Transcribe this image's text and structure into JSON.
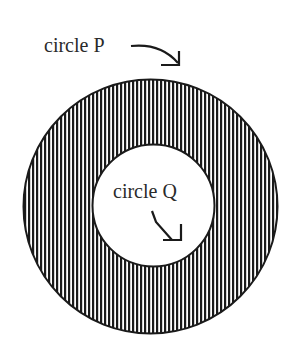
{
  "diagram": {
    "type": "concentric-circles",
    "outer_circle": {
      "label": "circle P",
      "cx": 150.5,
      "cy": 206.5,
      "r": 127,
      "fill": "vertical-stripes",
      "stroke": "#1a1a1a"
    },
    "inner_circle": {
      "label": "circle Q",
      "cx": 153.5,
      "cy": 205.5,
      "r": 61,
      "fill": "#ffffff",
      "stroke": "#1a1a1a"
    },
    "stripe_color": "#1a1a1a",
    "background_color": "#ffffff"
  },
  "labels": {
    "circle_p": "circle P",
    "circle_q": "circle Q"
  }
}
